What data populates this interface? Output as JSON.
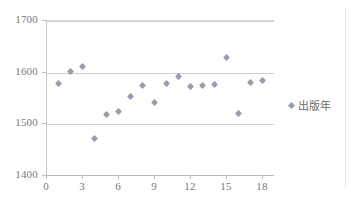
{
  "chart_data": {
    "type": "scatter",
    "title": "",
    "xlabel": "",
    "ylabel": "",
    "xlim": [
      0,
      19
    ],
    "ylim": [
      1400,
      1700
    ],
    "grid": true,
    "legend_position": "right",
    "series": [
      {
        "name": "出版年",
        "marker": "diamond",
        "color": "#9b9bb0",
        "x": [
          1,
          2,
          3,
          4,
          5,
          6,
          7,
          8,
          9,
          10,
          11,
          12,
          13,
          14,
          15,
          16,
          17,
          18
        ],
        "values": [
          1577,
          1600,
          1610,
          1470,
          1518,
          1522,
          1552,
          1573,
          1540,
          1577,
          1590,
          1572,
          1573,
          1575,
          1627,
          1520,
          1580,
          1583
        ]
      }
    ],
    "x_ticks": [
      {
        "value": 0,
        "label": "0"
      },
      {
        "value": 3,
        "label": "3"
      },
      {
        "value": 6,
        "label": "6"
      },
      {
        "value": 9,
        "label": "9"
      },
      {
        "value": 12,
        "label": "12"
      },
      {
        "value": 15,
        "label": "15"
      },
      {
        "value": 18,
        "label": "18"
      }
    ],
    "y_ticks": [
      {
        "value": 1400,
        "label": "1400"
      },
      {
        "value": 1500,
        "label": "1500"
      },
      {
        "value": 1600,
        "label": "1600"
      },
      {
        "value": 1700,
        "label": "1700"
      }
    ]
  },
  "legend": {
    "entries": [
      {
        "label": "出版年",
        "marker_name": "diamond-marker"
      }
    ]
  }
}
